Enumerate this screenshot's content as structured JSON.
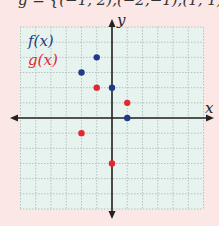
{
  "caption": "g = {(−1, 2),(−2,−1),(1, 1),(0,−3)}",
  "legend": {
    "f_label": "f(x)",
    "g_label": "g(x)",
    "f_color": "#1f3a8a",
    "g_color": "#e0282e"
  },
  "axes": {
    "x_label": "x",
    "y_label": "y"
  },
  "chart_data": {
    "type": "scatter",
    "title": "",
    "xlabel": "x",
    "ylabel": "y",
    "xlim": [
      -6,
      6
    ],
    "ylim": [
      -6,
      6
    ],
    "grid": true,
    "legend_position": "top-left",
    "series": [
      {
        "name": "f(x)",
        "color": "#1f3a8a",
        "points": [
          [
            -1,
            4
          ],
          [
            -2,
            3
          ],
          [
            0,
            2
          ],
          [
            1,
            0
          ]
        ]
      },
      {
        "name": "g(x)",
        "color": "#e0282e",
        "points": [
          [
            -1,
            2
          ],
          [
            1,
            1
          ],
          [
            -2,
            -1
          ],
          [
            0,
            -3
          ]
        ]
      }
    ]
  }
}
